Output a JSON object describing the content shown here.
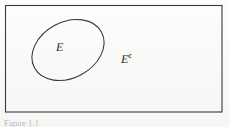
{
  "figure": {
    "type": "venn-complement-diagram",
    "background_color": "#fbfbf9",
    "stroke_color": "#3a3a3a",
    "caption": "Figure 1.1",
    "sample_space": {
      "name": "sample-space-rectangle",
      "x": 5,
      "y": 5,
      "width": 217,
      "height": 107,
      "stroke_width": 1.1
    },
    "event_region": {
      "name": "event-ellipse",
      "cx": 68,
      "cy": 50,
      "rx": 38,
      "ry": 28,
      "rotation_deg": -28,
      "stroke_width": 1.1,
      "fill": "none"
    },
    "labels": {
      "event": "E",
      "complement_base": "E",
      "complement_superscript": "c"
    }
  }
}
